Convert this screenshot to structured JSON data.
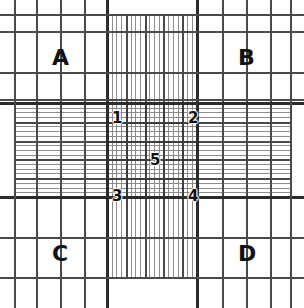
{
  "figure": {
    "kind": "hemocytometer-counting-chamber-grid",
    "width": 304,
    "height": 308,
    "background_color": "#ffffff",
    "line_color_major": "#4a4a4a",
    "line_color_bold": "#2b2b2b",
    "line_color_fine": "#8e8e8e",
    "label_color": "#111111"
  },
  "quadrant_labels": [
    {
      "text": "A",
      "x": 52,
      "y": 47
    },
    {
      "text": "B",
      "x": 238,
      "y": 47
    },
    {
      "text": "C",
      "x": 52,
      "y": 243
    },
    {
      "text": "D",
      "x": 238,
      "y": 243
    }
  ],
  "center_cell_labels": [
    {
      "text": "1",
      "x": 112,
      "y": 111
    },
    {
      "text": "2",
      "x": 188,
      "y": 111
    },
    {
      "text": "5",
      "x": 150,
      "y": 153
    },
    {
      "text": "3",
      "x": 112,
      "y": 189
    },
    {
      "text": "4",
      "x": 188,
      "y": 189
    }
  ],
  "frame": {
    "left": 14,
    "right": 290,
    "top": 14,
    "bottom": 277
  },
  "center_square": {
    "left": 107,
    "right": 197,
    "top": 103,
    "bottom": 197
  },
  "major_verticals": [
    36,
    60,
    84,
    222,
    246,
    270
  ],
  "bold_verticals": [
    107,
    197
  ],
  "major_horizontals": [
    31,
    72,
    99,
    237
  ],
  "bold_horizontals": [
    103,
    197
  ],
  "frame_lines": {
    "top": 14,
    "bottom": 277,
    "left": 14,
    "right": 290
  }
}
